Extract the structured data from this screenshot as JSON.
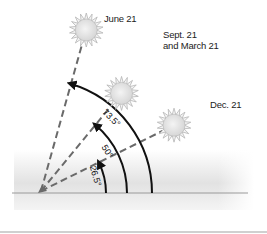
{
  "suns": [
    {
      "id": "june",
      "label": "June 21",
      "angle_deg": 73.5
    },
    {
      "id": "equinox",
      "label_lines": [
        "Sept. 21",
        "and March 21"
      ],
      "angle_deg": 50
    },
    {
      "id": "december",
      "label": "Dec. 21",
      "angle_deg": 26.5
    }
  ],
  "angle_labels": [
    "73.5°",
    "50°",
    "26.5°"
  ],
  "colors": {
    "line": "#111111",
    "dash": "#6a6a6a",
    "sun_fill": "#e6e6e6",
    "sun_stroke": "#b5b5b5",
    "ground": "#e4e4e4",
    "ground_line": "#9a9a9a"
  }
}
